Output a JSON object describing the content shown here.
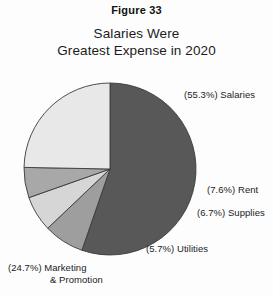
{
  "figure": {
    "label": "Figure 33",
    "title_line1": "Salaries Were",
    "title_line2": "Greatest Expense in 2020"
  },
  "labels": {
    "salaries": "(55.3%) Salaries",
    "rent": "(7.6%) Rent",
    "supplies": "(6.7%) Supplies",
    "utilities": "(5.7%) Utilities",
    "marketing_line1": "(24.7%) Marketing",
    "marketing_line2": "& Promotion"
  },
  "colors": {
    "salaries": "#585858",
    "rent": "#9e9e9e",
    "supplies": "#d6d6d6",
    "utilities": "#a8a8a8",
    "marketing": "#e8e8e8",
    "outline": "#3a3a3a",
    "background": "#fdfdfd",
    "text": "#1b1b1b"
  },
  "chart_data": {
    "type": "pie",
    "title": "Salaries Were Greatest Expense in 2020",
    "subtitle": "Figure 33",
    "xlabel": "",
    "ylabel": "",
    "legend": "none (direct slice labels)",
    "grid": false,
    "units": "percent",
    "total": 100.0,
    "start_angle_deg": 0,
    "direction": "clockwise",
    "categories": [
      "Salaries",
      "Rent",
      "Supplies",
      "Utilities",
      "Marketing & Promotion"
    ],
    "values": [
      55.3,
      7.6,
      6.7,
      5.7,
      24.7
    ],
    "slices": [
      {
        "name": "Salaries",
        "value": 55.3,
        "label": "(55.3%) Salaries",
        "color": "#585858"
      },
      {
        "name": "Rent",
        "value": 7.6,
        "label": "(7.6%) Rent",
        "color": "#9e9e9e"
      },
      {
        "name": "Supplies",
        "value": 6.7,
        "label": "(6.7%) Supplies",
        "color": "#d6d6d6"
      },
      {
        "name": "Utilities",
        "value": 5.7,
        "label": "(5.7%) Utilities",
        "color": "#a8a8a8"
      },
      {
        "name": "Marketing & Promotion",
        "value": 24.7,
        "label": "(24.7%) Marketing & Promotion",
        "color": "#e8e8e8"
      }
    ]
  }
}
